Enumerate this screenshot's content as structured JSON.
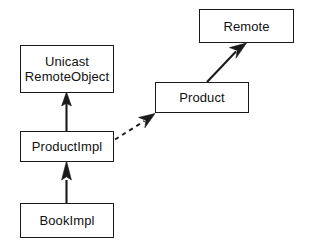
{
  "diagram": {
    "type": "uml-class-diagram",
    "title": "",
    "background_color": "#ffffff",
    "line_color": "#1a1a1a",
    "text_color": "#111111",
    "canvas": {
      "width": 311,
      "height": 248
    },
    "classes": [
      {
        "id": "remote",
        "name": "Remote",
        "lines": [
          "Remote"
        ],
        "x": 199,
        "y": 9,
        "width": 95,
        "height": 34
      },
      {
        "id": "unicast-remote-object",
        "name": "UnicastRemoteObject",
        "lines": [
          "Unicast",
          "RemoteObject"
        ],
        "x": 20,
        "y": 45,
        "width": 94,
        "height": 48
      },
      {
        "id": "product",
        "name": "Product",
        "lines": [
          "Product"
        ],
        "x": 155,
        "y": 82,
        "width": 94,
        "height": 31
      },
      {
        "id": "product-impl",
        "name": "ProductImpl",
        "lines": [
          "ProductImpl"
        ],
        "x": 20,
        "y": 131,
        "width": 94,
        "height": 31
      },
      {
        "id": "book-impl",
        "name": "BookImpl",
        "lines": [
          "BookImpl"
        ],
        "x": 20,
        "y": 203,
        "width": 94,
        "height": 35
      }
    ],
    "edges": [
      {
        "id": "product-impl-extends-unicast",
        "from": "product-impl",
        "to": "unicast-remote-object",
        "style": "solid",
        "arrowhead": "filled",
        "label": ""
      },
      {
        "id": "book-impl-extends-product-impl",
        "from": "book-impl",
        "to": "product-impl",
        "style": "solid",
        "arrowhead": "filled",
        "label": ""
      },
      {
        "id": "product-impl-implements-product",
        "from": "product-impl",
        "to": "product",
        "style": "dashed",
        "arrowhead": "filled",
        "label": ""
      },
      {
        "id": "product-extends-remote",
        "from": "product",
        "to": "remote",
        "style": "solid",
        "arrowhead": "filled",
        "label": ""
      }
    ]
  }
}
